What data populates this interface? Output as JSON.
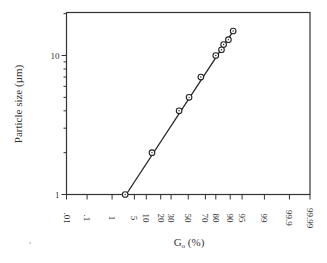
{
  "chart_data": {
    "type": "line",
    "title": "",
    "xlabel": "G",
    "xlabel_subscript": "o",
    "xlabel_suffix": " (%)",
    "ylabel": "Particle size (µm)",
    "x_scale": "normal-probability",
    "y_scale": "log",
    "xlim": [
      0.01,
      99.99
    ],
    "ylim": [
      1,
      20
    ],
    "x_ticks": [
      0.01,
      0.1,
      1,
      5,
      10,
      20,
      30,
      50,
      70,
      80,
      90,
      95,
      99,
      99.9,
      99.99
    ],
    "x_tick_labels": [
      ".01",
      ".1",
      "1",
      "5",
      "10",
      "20",
      "30",
      "50",
      "70",
      "80",
      "90",
      "95",
      "99",
      "99.9",
      "99.99"
    ],
    "y_major_ticks": [
      1,
      10
    ],
    "y_tick_labels": [
      "1",
      "10"
    ],
    "y_minor_ticks": [
      2,
      3,
      4,
      5,
      6,
      7,
      8,
      9,
      20
    ],
    "grid": false,
    "legend": "none",
    "series": [
      {
        "name": "Particle size distribution",
        "marker": "circle-dot",
        "points": [
          {
            "x": 2.7,
            "y": 1
          },
          {
            "x": 13.4,
            "y": 2
          },
          {
            "x": 39,
            "y": 4
          },
          {
            "x": 51,
            "y": 5
          },
          {
            "x": 65,
            "y": 7
          },
          {
            "x": 80,
            "y": 10
          },
          {
            "x": 84.5,
            "y": 11
          },
          {
            "x": 86,
            "y": 12
          },
          {
            "x": 89,
            "y": 13
          },
          {
            "x": 91.5,
            "y": 15
          }
        ]
      }
    ]
  }
}
